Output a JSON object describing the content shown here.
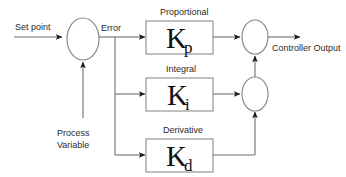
{
  "diagram": {
    "type": "control-block-diagram",
    "colors": {
      "background": "#ffffff",
      "wire": "#6f6f6f",
      "block_border": "#8a8a8a",
      "text": "#2a2a2a",
      "arrow_head": "#1c1c1c"
    },
    "signals": {
      "set_point": "Set point",
      "error": "Error",
      "process_variable_line1": "Process",
      "process_variable_line2": "Variable",
      "controller_output": "Controller Output"
    },
    "blocks": [
      {
        "id": "proportional",
        "caption": "Proportional",
        "gain_symbol": "K",
        "gain_subscript": "p"
      },
      {
        "id": "integral",
        "caption": "Integral",
        "gain_symbol": "K",
        "gain_subscript": "i"
      },
      {
        "id": "derivative",
        "caption": "Derivative",
        "gain_symbol": "K",
        "gain_subscript": "d"
      }
    ],
    "junctions": [
      {
        "id": "error-summer",
        "label": ""
      },
      {
        "id": "output-summer-top",
        "label": ""
      },
      {
        "id": "output-summer-bottom",
        "label": ""
      }
    ]
  }
}
